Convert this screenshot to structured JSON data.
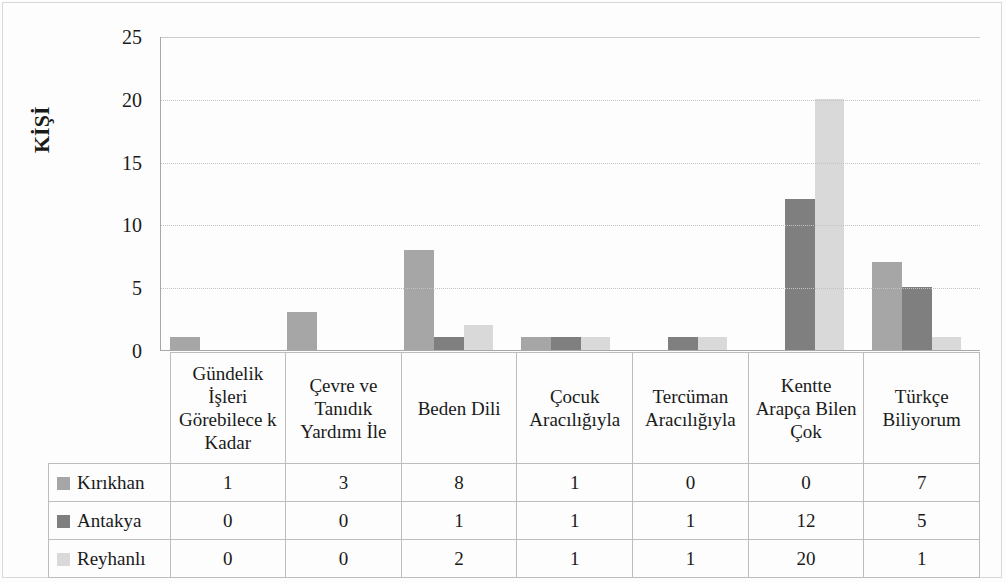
{
  "chart_data": {
    "type": "bar",
    "title": "",
    "subtitle": "",
    "xlabel": "",
    "ylabel": "KİŞİ",
    "ylim": [
      0,
      25
    ],
    "ytick_values": [
      25,
      20,
      15,
      10,
      5,
      0
    ],
    "ytick_labels": [
      "25",
      "20",
      "15",
      "10",
      "5",
      "0"
    ],
    "grid": true,
    "grid_axis": "y",
    "legend_position": "table-left-column",
    "categories": [
      "Gündelik İşleri Görebilece k Kadar",
      "Çevre ve Tanıdık Yardımı İle",
      "Beden Dili",
      "Çocuk Aracılığıyla",
      "Tercüman Aracılığıyla",
      "Kentte Arapça Bilen Çok",
      "Türkçe Biliyorum"
    ],
    "series": [
      {
        "name": "Kırıkhan",
        "color": "#a6a6a6",
        "values": [
          1,
          3,
          8,
          1,
          0,
          0,
          7
        ]
      },
      {
        "name": "Antakya",
        "color": "#7f7f7f",
        "values": [
          0,
          0,
          1,
          1,
          1,
          12,
          5
        ]
      },
      {
        "name": "Reyhanlı",
        "color": "#d9d9d9",
        "values": [
          0,
          0,
          2,
          1,
          1,
          20,
          1
        ]
      }
    ]
  },
  "table": {
    "legend_header": "",
    "rows": [
      {
        "label": "Kırıkhan",
        "values": [
          "1",
          "3",
          "8",
          "1",
          "0",
          "0",
          "7"
        ]
      },
      {
        "label": "Antakya",
        "values": [
          "0",
          "0",
          "1",
          "1",
          "1",
          "12",
          "5"
        ]
      },
      {
        "label": "Reyhanlı",
        "values": [
          "0",
          "0",
          "2",
          "1",
          "1",
          "20",
          "1"
        ]
      }
    ]
  }
}
